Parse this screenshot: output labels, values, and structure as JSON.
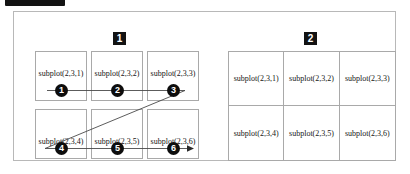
{
  "caption": {
    "badge_label": "",
    "text": ""
  },
  "figure": {
    "panels": [
      {
        "badge": "1",
        "layout": "separated",
        "cells": [
          {
            "label": "subplot(2,3,1)",
            "step": "1"
          },
          {
            "label": "subplot(2,3,2)",
            "step": "2"
          },
          {
            "label": "subplot(2,3,3)",
            "step": "3"
          },
          {
            "label": "subplot(2,3,4)",
            "step": "4"
          },
          {
            "label": "subplot(2,3,5)",
            "step": "5"
          },
          {
            "label": "subplot(2,3,6)",
            "step": "6"
          }
        ]
      },
      {
        "badge": "2",
        "layout": "contiguous",
        "cells": [
          {
            "label": "subplot(2,3,1)"
          },
          {
            "label": "subplot(2,3,2)"
          },
          {
            "label": "subplot(2,3,3)"
          },
          {
            "label": "subplot(2,3,4)"
          },
          {
            "label": "subplot(2,3,5)"
          },
          {
            "label": "subplot(2,3,6)"
          }
        ]
      }
    ]
  },
  "colors": {
    "frame_border": "#b8b8b8",
    "cell_border": "#a9a9a9",
    "badge_bg": "#131313",
    "badge_fg": "#ffffff",
    "path_stroke": "#4a4a4a",
    "text": "#161616"
  }
}
